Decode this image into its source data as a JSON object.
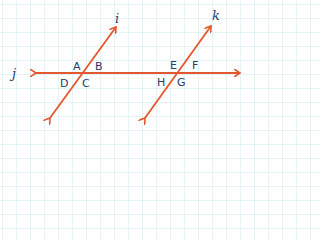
{
  "diagram": {
    "line_color": "#e4572e",
    "text_color": "#2b3a67",
    "lines": {
      "horizontal": "j",
      "transversal_left": "i",
      "transversal_right": "k"
    },
    "angles_left": {
      "top_left": "A",
      "top_right": "B",
      "bottom_left": "D",
      "bottom_right": "C"
    },
    "angles_right": {
      "top_left": "E",
      "top_right": "F",
      "bottom_left": "H",
      "bottom_right": "G"
    }
  }
}
